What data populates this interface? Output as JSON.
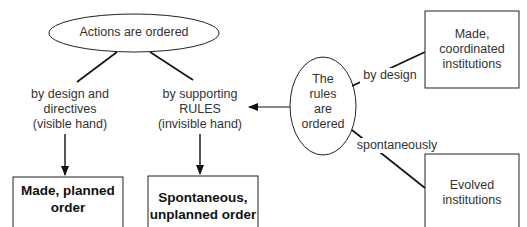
{
  "diagram": {
    "top_node": "Actions are ordered",
    "branch_left": [
      "by design and",
      "directives",
      "(visible hand)"
    ],
    "branch_right": [
      "by supporting",
      "RULES",
      "(invisible hand)"
    ],
    "result_left": [
      "Made, planned",
      "order"
    ],
    "result_right": [
      "Spontaneous,",
      "unplanned order"
    ],
    "rules_node": [
      "The",
      "rules",
      "are",
      "ordered"
    ],
    "edge_upper_label": "by design",
    "edge_lower_label": "spontaneously",
    "inst_upper": [
      "Made,",
      "coordinated",
      "institutions"
    ],
    "inst_lower": [
      "Evolved",
      "institutions"
    ]
  }
}
